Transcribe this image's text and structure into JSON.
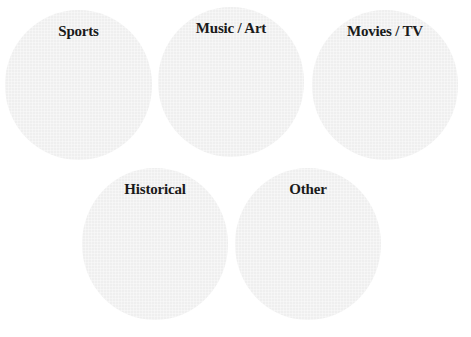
{
  "colors": {
    "background": "#ffffff",
    "circle_fill": "#efefef",
    "label_text": "#1a1a1a"
  },
  "circles": [
    {
      "label": "Sports"
    },
    {
      "label": "Music / Art"
    },
    {
      "label": "Movies / TV"
    },
    {
      "label": "Historical"
    },
    {
      "label": "Other"
    }
  ]
}
